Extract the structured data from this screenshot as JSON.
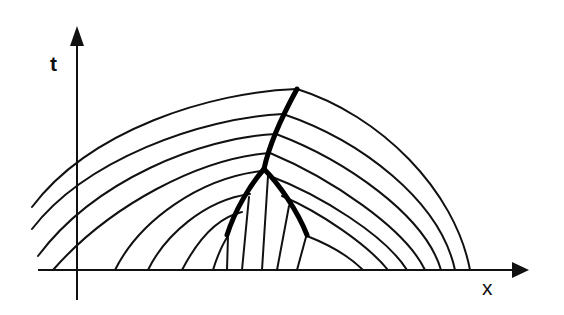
{
  "diagram": {
    "axes": {
      "vertical_label": "t",
      "horizontal_label": "x"
    },
    "colors": {
      "line": "#111111",
      "shock": "#000000",
      "background": "#ffffff"
    },
    "elements": {
      "left_family_arcs": 8,
      "right_family_arcs": 7,
      "inner_characteristics": 5,
      "shock_branches": [
        "left-shock",
        "right-shock",
        "merged-shock"
      ]
    }
  }
}
